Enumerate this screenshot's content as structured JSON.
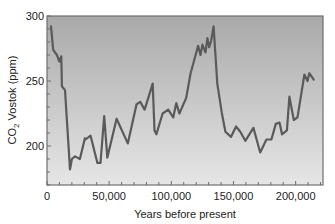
{
  "chart_data": {
    "type": "line",
    "title": "",
    "xlabel": "Years before present",
    "ylabel": "CO2 Vostok (ppm)",
    "ylabel_parts": {
      "main": "CO",
      "subscript": "2",
      "rest": " Vostok (ppm)"
    },
    "xlim": [
      0,
      222000
    ],
    "ylim": [
      170,
      300
    ],
    "x_ticks": [
      0,
      50000,
      100000,
      150000,
      200000
    ],
    "x_tick_labels": [
      "0",
      "50,000",
      "100,000",
      "150,000",
      "200,000"
    ],
    "x_minor_step": 10000,
    "y_ticks": [
      200,
      250,
      300
    ],
    "y_tick_labels": [
      "200",
      "250",
      "300"
    ],
    "y_minor_step": 10,
    "grid": false,
    "legend": null,
    "colors": {
      "line": "#5a5a5a",
      "plot_bg_top": "#a9a9a9",
      "plot_bg_bottom": "#e6e6e6",
      "frame": "#6e6e6e"
    },
    "series": [
      {
        "name": "CO2 Vostok",
        "x": [
          3200,
          5000,
          8000,
          10000,
          11500,
          12000,
          14500,
          18500,
          20000,
          22500,
          26500,
          30500,
          31000,
          35000,
          40500,
          43000,
          46000,
          48500,
          56000,
          65000,
          72000,
          75000,
          78500,
          81500,
          85000,
          86500,
          88000,
          93000,
          97500,
          101500,
          104000,
          106500,
          112000,
          115500,
          119500,
          121500,
          123500,
          125000,
          127500,
          129000,
          130500,
          132000,
          134000,
          137000,
          140500,
          143500,
          148000,
          152000,
          155500,
          159500,
          166000,
          171500,
          176500,
          180500,
          184000,
          187000,
          189000,
          193000,
          195000,
          198500,
          201500,
          207000,
          209500,
          211000,
          214500
        ],
        "values": [
          292,
          274,
          270,
          265,
          269,
          246,
          243,
          182,
          190,
          192,
          190,
          206,
          205,
          208,
          187,
          187,
          223,
          191,
          221,
          202,
          232,
          234,
          228,
          237,
          248,
          212,
          209,
          225,
          228,
          222,
          233,
          225,
          237,
          256,
          270,
          277,
          270,
          278,
          272,
          283,
          276,
          281,
          292,
          248,
          226,
          211,
          207,
          215,
          211,
          204,
          214,
          195,
          205,
          205,
          217,
          218,
          209,
          212,
          238,
          220,
          222,
          255,
          250,
          256,
          251
        ]
      }
    ]
  }
}
